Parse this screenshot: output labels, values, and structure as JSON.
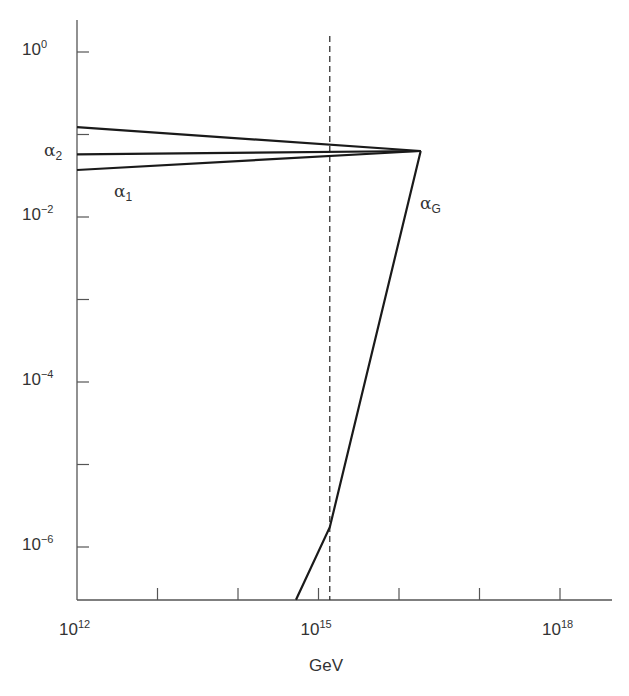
{
  "chart_data": {
    "type": "line",
    "title": "",
    "xlabel": "GeV",
    "ylabel": "",
    "xscale": "log",
    "yscale": "log",
    "xlim_log10": [
      12,
      18.7
    ],
    "ylim_log10": [
      -6.65,
      0.45
    ],
    "x_tick_labels": [
      {
        "base": "10",
        "exp": "12",
        "log10": 12
      },
      {
        "base": "10",
        "exp": "15",
        "log10": 15
      },
      {
        "base": "10",
        "exp": "18",
        "log10": 18
      }
    ],
    "x_minor_ticks_log10": [
      13,
      14,
      15,
      16,
      17,
      18
    ],
    "y_tick_labels": [
      {
        "base": "10",
        "exp": "0",
        "log10": 0
      },
      {
        "base": "10",
        "exp": "−2",
        "log10": -2
      },
      {
        "base": "10",
        "exp": "−4",
        "log10": -4
      },
      {
        "base": "10",
        "exp": "−6",
        "log10": -6
      }
    ],
    "y_minor_ticks_log10": [
      -1,
      -3,
      -5
    ],
    "grid": false,
    "series": [
      {
        "name": "α3",
        "label": "",
        "points_log10": [
          [
            12,
            -0.91
          ],
          [
            16.27,
            -1.2
          ]
        ]
      },
      {
        "name": "α2",
        "label": "α",
        "sub": "2",
        "points_log10": [
          [
            12,
            -1.24
          ],
          [
            16.27,
            -1.2
          ]
        ]
      },
      {
        "name": "α1",
        "label": "α",
        "sub": "1",
        "points_log10": [
          [
            12,
            -1.43
          ],
          [
            16.27,
            -1.2
          ]
        ]
      },
      {
        "name": "αG",
        "label": "α",
        "sub": "G",
        "points_log10": [
          [
            14.72,
            -6.64
          ],
          [
            15.14,
            -5.76
          ],
          [
            16.27,
            -1.2
          ]
        ]
      }
    ],
    "annotations": [
      {
        "type": "vline",
        "style": "dashed",
        "x_log10": 15.14
      }
    ]
  },
  "labels": {
    "alpha2": {
      "sym": "α",
      "sub": "2"
    },
    "alpha1": {
      "sym": "α",
      "sub": "1"
    },
    "alphaG": {
      "sym": "α",
      "sub": "G"
    },
    "xlabel": "GeV"
  },
  "colors": {
    "line": "#1a1a1a",
    "axis": "#555555"
  }
}
